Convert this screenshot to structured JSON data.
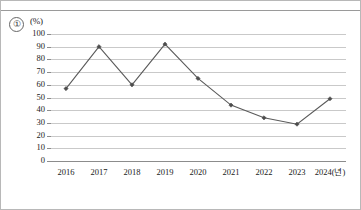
{
  "frame": {
    "item_number": "①",
    "unit_label": "(%)"
  },
  "chart_data": {
    "type": "line",
    "title": "",
    "xlabel": "",
    "ylabel": "(%)",
    "categories": [
      "2016",
      "2017",
      "2018",
      "2019",
      "2020",
      "2021",
      "2022",
      "2023",
      "2024(년)"
    ],
    "x_values": [
      2016,
      2017,
      2018,
      2019,
      2020,
      2021,
      2022,
      2023,
      2024
    ],
    "values": [
      57,
      90,
      60,
      92,
      65,
      44,
      34,
      29,
      49
    ],
    "ylim": [
      0,
      100
    ],
    "y_ticks": [
      "100",
      "90",
      "80",
      "70",
      "60",
      "50",
      "40",
      "30",
      "20",
      "10",
      "0"
    ],
    "y_tick_values": [
      100,
      90,
      80,
      70,
      60,
      50,
      40,
      30,
      20,
      10,
      0
    ],
    "grid": true,
    "legend": false,
    "legend_position": "none",
    "series": [
      {
        "name": "",
        "values": [
          57,
          90,
          60,
          92,
          65,
          44,
          34,
          29,
          49
        ],
        "line_color": "#5a5a5a",
        "marker_color": "#4d4d4d",
        "marker": "diamond"
      }
    ],
    "colors": {
      "line": "#5a5a5a",
      "marker": "#4d4d4d",
      "gridline": "#c9c9c9",
      "axis": "#8c8c8c",
      "text": "#1a1a1a",
      "background": "#ffffff"
    }
  }
}
